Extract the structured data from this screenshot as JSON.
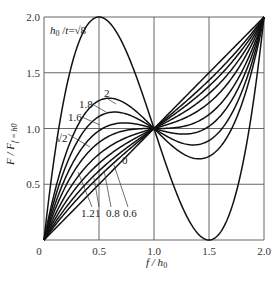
{
  "chart_data": {
    "type": "line",
    "title": "",
    "xlabel": "f / h0",
    "ylabel": "F / F_{f=h0}",
    "xlim": [
      0,
      2.0
    ],
    "ylim": [
      0,
      2.0
    ],
    "xticks": [
      "0",
      "0.5",
      "1.0",
      "1.5",
      "2.0"
    ],
    "yticks": [
      "0.5",
      "1.0",
      "1.5",
      "2.0"
    ],
    "grid": true,
    "formula": "F/F_{f=h0} = (f/h0) * [ r^2 (1 - f/h0)(1 - f/(2 h0)) + 1 ], r = h0/t",
    "series_param_label": "h0/t",
    "series": [
      {
        "name": "0",
        "r": 0
      },
      {
        "name": "0.6",
        "r": 0.6
      },
      {
        "name": "0.8",
        "r": 0.8
      },
      {
        "name": "1",
        "r": 1.0
      },
      {
        "name": "1.2",
        "r": 1.2
      },
      {
        "name": "√2",
        "r": 1.41421
      },
      {
        "name": "1.6",
        "r": 1.6
      },
      {
        "name": "1.8",
        "r": 1.8
      },
      {
        "name": "2",
        "r": 2.0
      },
      {
        "name": "h0/t = √8",
        "r": 2.82843
      }
    ],
    "key_points": [
      {
        "series": "√8",
        "x": 0.5,
        "y": 2.0
      },
      {
        "series": "√8",
        "x": 1.5,
        "y": 0.0
      },
      {
        "series": "all",
        "x": 1.0,
        "y": 1.0
      },
      {
        "series": "all",
        "x": 2.0,
        "y": 2.0
      }
    ]
  },
  "labels": {
    "xaxis": "f / h",
    "xaxis_sub": "0",
    "yaxis": "F / F",
    "yaxis_sub": "f = h0",
    "top_curve": "h0 /t = √8",
    "c2": "2",
    "c18": "1.8",
    "c16": "1.6",
    "csqrt2": "√2",
    "c12": "1.2",
    "c1": "1",
    "c08": "0.8",
    "c06": "0.6",
    "c0": "0"
  }
}
